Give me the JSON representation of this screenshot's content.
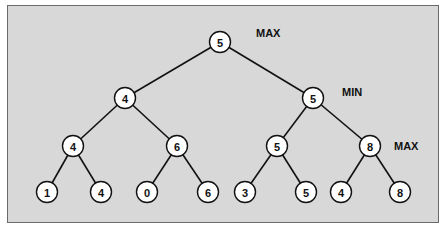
{
  "diagram": {
    "type": "minimax-game-tree",
    "level_labels": [
      {
        "text": "MAX",
        "x": 256,
        "y": 27
      },
      {
        "text": "MIN",
        "x": 342,
        "y": 86
      },
      {
        "text": "MAX",
        "x": 394,
        "y": 140
      }
    ],
    "nodes": [
      {
        "id": "n0",
        "value": "5",
        "x": 220,
        "y": 42
      },
      {
        "id": "n1",
        "value": "4",
        "x": 125,
        "y": 98
      },
      {
        "id": "n2",
        "value": "5",
        "x": 313,
        "y": 98
      },
      {
        "id": "n3",
        "value": "4",
        "x": 73,
        "y": 146
      },
      {
        "id": "n4",
        "value": "6",
        "x": 177,
        "y": 146
      },
      {
        "id": "n5",
        "value": "5",
        "x": 277,
        "y": 146
      },
      {
        "id": "n6",
        "value": "8",
        "x": 370,
        "y": 146
      },
      {
        "id": "n7",
        "value": "1",
        "x": 47,
        "y": 192
      },
      {
        "id": "n8",
        "value": "4",
        "x": 101,
        "y": 192
      },
      {
        "id": "n9",
        "value": "0",
        "x": 147,
        "y": 192
      },
      {
        "id": "n10",
        "value": "6",
        "x": 208,
        "y": 192
      },
      {
        "id": "n11",
        "value": "3",
        "x": 245,
        "y": 192
      },
      {
        "id": "n12",
        "value": "5",
        "x": 306,
        "y": 192
      },
      {
        "id": "n13",
        "value": "4",
        "x": 341,
        "y": 192
      },
      {
        "id": "n14",
        "value": "8",
        "x": 400,
        "y": 192
      }
    ],
    "edges": [
      [
        "n0",
        "n1"
      ],
      [
        "n0",
        "n2"
      ],
      [
        "n1",
        "n3"
      ],
      [
        "n1",
        "n4"
      ],
      [
        "n2",
        "n5"
      ],
      [
        "n2",
        "n6"
      ],
      [
        "n3",
        "n7"
      ],
      [
        "n3",
        "n8"
      ],
      [
        "n4",
        "n9"
      ],
      [
        "n4",
        "n10"
      ],
      [
        "n5",
        "n11"
      ],
      [
        "n5",
        "n12"
      ],
      [
        "n6",
        "n13"
      ],
      [
        "n6",
        "n14"
      ]
    ]
  }
}
